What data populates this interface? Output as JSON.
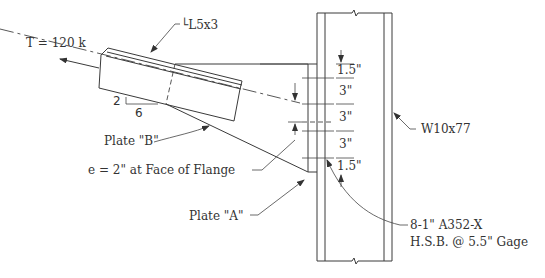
{
  "diagram": {
    "labels": {
      "force": "T = 120 k",
      "angle": "└L5x3",
      "slope_rise": "2",
      "slope_run": "6",
      "plate_b": "Plate \"B\"",
      "eccentricity": "e = 2\" at Face of Flange",
      "plate_a": "Plate \"A\"",
      "column": "W10x77",
      "bolts_line1": "8-1\" A352-X",
      "bolts_line2": "H.S.B. @ 5.5\" Gage"
    },
    "bolt_spacing": [
      {
        "label": "1.5\""
      },
      {
        "label": "3\""
      },
      {
        "label": "3\""
      },
      {
        "label": "3\""
      },
      {
        "label": "1.5\""
      }
    ],
    "colors": {
      "line": "#3a3a3a",
      "text": "#333333",
      "background": "#ffffff"
    }
  }
}
